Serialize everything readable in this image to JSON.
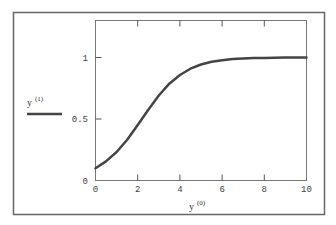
{
  "chart_data": {
    "type": "line",
    "title": "",
    "xlabel": "y <0>",
    "ylabel": "y <1>",
    "xlabel_base": "y",
    "xlabel_sup": "(0)",
    "ylabel_base": "y",
    "ylabel_sup": "(1)",
    "xlim": [
      0,
      10
    ],
    "ylim": [
      0,
      1.2
    ],
    "x_ticks": [
      0,
      2,
      4,
      6,
      8,
      10
    ],
    "x_tick_labels": [
      "0",
      "2",
      "4",
      "6",
      "8",
      "10"
    ],
    "y_ticks": [
      0,
      0.5,
      1
    ],
    "y_tick_labels": [
      "0",
      "0.5",
      "1"
    ],
    "grid": false,
    "legend_position": "left",
    "series": [
      {
        "name": "y <1>",
        "color": "#444444",
        "x": [
          0,
          0.5,
          1,
          1.5,
          2,
          2.5,
          3,
          3.5,
          4,
          4.5,
          5,
          5.5,
          6,
          6.5,
          7,
          7.5,
          8,
          8.5,
          9,
          9.5,
          10
        ],
        "y": [
          0.1,
          0.155,
          0.232,
          0.332,
          0.451,
          0.575,
          0.691,
          0.787,
          0.858,
          0.909,
          0.943,
          0.965,
          0.978,
          0.987,
          0.992,
          0.995,
          0.997,
          0.998,
          0.999,
          0.999,
          1.0
        ]
      }
    ]
  }
}
